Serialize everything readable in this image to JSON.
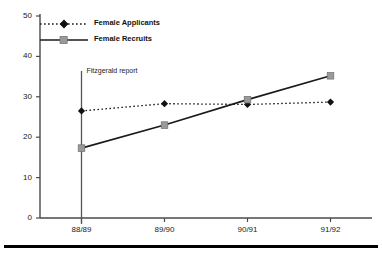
{
  "chart_data": {
    "type": "line",
    "title": "",
    "subtitle": "",
    "xlabel": "",
    "ylabel": "",
    "categories": [
      "88/89",
      "89/90",
      "90/91",
      "91/92"
    ],
    "ylim": [
      0,
      50
    ],
    "yticks": [
      0,
      10,
      20,
      30,
      40,
      50
    ],
    "ytick_labels": [
      "0",
      "10",
      "20",
      "30",
      "40",
      "50"
    ],
    "grid": false,
    "legend_position": "top-left",
    "series": [
      {
        "name": "Female Applicants",
        "values": [
          26.5,
          28.3,
          28.1,
          28.7
        ],
        "line_style": "dotted",
        "marker": "diamond",
        "color": "#1a1a1a"
      },
      {
        "name": "Female Recruits",
        "values": [
          17.3,
          23.0,
          29.3,
          35.2
        ],
        "line_style": "solid",
        "marker": "square",
        "color": "#1a1a1a",
        "marker_color": "#9a9a9a"
      }
    ],
    "annotations": [
      {
        "text": "Fitzgerald report",
        "at_category": "88/89",
        "type": "vertical-line-with-label"
      }
    ]
  },
  "footer": {
    "rule": true,
    "clipped_text": ""
  }
}
